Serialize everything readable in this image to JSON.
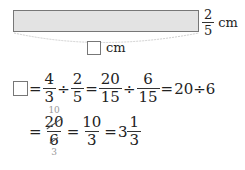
{
  "figure": {
    "side_length": {
      "numerator": "2",
      "denominator": "5",
      "unit": "cm"
    },
    "unknown_length_unit": "cm"
  },
  "line1": {
    "lhs_blank": "",
    "eq1": "=",
    "f1": {
      "numerator": "4",
      "denominator": "3"
    },
    "div1": "÷",
    "f2": {
      "numerator": "2",
      "denominator": "5"
    },
    "eq2": "=",
    "f3": {
      "numerator": "20",
      "denominator": "15"
    },
    "div2": "÷",
    "f4": {
      "numerator": "6",
      "denominator": "15"
    },
    "eq3": "=",
    "tail": "20÷6"
  },
  "line2": {
    "eq1": "=",
    "cancel_top": "10",
    "f1": {
      "numerator": "20",
      "denominator": "6"
    },
    "cancel_bottom": "3",
    "eq2": "=",
    "f2": {
      "numerator": "10",
      "denominator": "3"
    },
    "eq3": "=",
    "whole": "3",
    "f3": {
      "numerator": "1",
      "denominator": "3"
    }
  }
}
